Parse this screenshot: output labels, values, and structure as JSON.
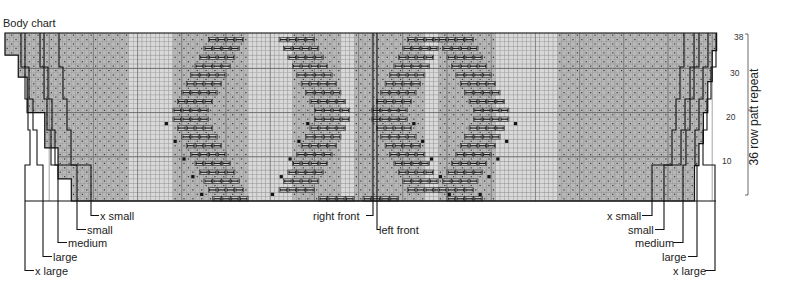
{
  "title": "Body chart",
  "chart": {
    "rows": 38,
    "repeat_label": "36 row patt repeat",
    "row_numbers": [
      "38",
      "30",
      "20",
      "10"
    ],
    "colors": {
      "background": "#ffffff",
      "stockinette": "#d9d9d9",
      "moss": "#b8b8b8",
      "grid_line": "#8a8a8a",
      "outline": "#111111",
      "cable_symbol": "#1a1a1a",
      "text": "#222222"
    }
  },
  "left_size_labels": [
    "x small",
    "small",
    "medium",
    "large",
    "x large"
  ],
  "right_size_labels": [
    "x small",
    "small",
    "medium",
    "large",
    "x large"
  ],
  "center_labels": {
    "right_front": "right front",
    "left_front": "left front"
  },
  "chart_data": {
    "type": "table",
    "title": "Body chart",
    "rows": 38,
    "row_ticks": [
      10,
      20,
      30,
      38
    ],
    "repeat_annotation": "36 row patt repeat",
    "sizes": [
      "x small",
      "small",
      "medium",
      "large",
      "x large"
    ],
    "panels": [
      "moss",
      "stockinette",
      "cable-diagonal-left",
      "stockinette",
      "cable-diamond-center",
      "stockinette",
      "cable-diagonal-right",
      "stockinette",
      "moss"
    ],
    "front_division": [
      "right front",
      "left front"
    ]
  }
}
